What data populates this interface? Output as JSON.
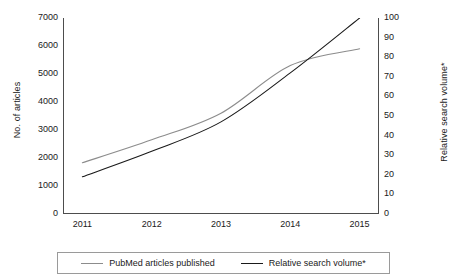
{
  "chart_data": {
    "type": "line",
    "title": "",
    "subtitle": "",
    "xlabel": "",
    "ylabel": "No. of articles",
    "y2label": "Relative search volume*",
    "categories": [
      "2011",
      "2012",
      "2013",
      "2014",
      "2015"
    ],
    "x": [
      2011,
      2012,
      2013,
      2014,
      2015
    ],
    "xlim": [
      2010.72,
      2015.28
    ],
    "ylim": [
      0,
      7000
    ],
    "y2lim": [
      0,
      100
    ],
    "yticks": [
      0,
      1000,
      2000,
      3000,
      4000,
      5000,
      6000,
      7000
    ],
    "y2ticks": [
      0,
      10,
      20,
      30,
      40,
      50,
      60,
      70,
      80,
      90,
      100
    ],
    "grid": false,
    "legend_position": "bottom",
    "series": [
      {
        "name": "PubMed articles published",
        "axis": "left",
        "color": "#8c8c8c",
        "values": [
          1830,
          2650,
          3600,
          5300,
          5900
        ]
      },
      {
        "name": "Relative search volume*",
        "axis": "right",
        "color": "#1a1a1a",
        "values": [
          19,
          32,
          47,
          72,
          100
        ]
      }
    ],
    "annotations": []
  },
  "axes": {
    "left": {
      "label": "No. of articles",
      "ticks": [
        "0",
        "1000",
        "2000",
        "3000",
        "4000",
        "5000",
        "6000",
        "7000"
      ]
    },
    "right": {
      "label": "Relative search volume*",
      "ticks": [
        "0",
        "10",
        "20",
        "30",
        "40",
        "50",
        "60",
        "70",
        "80",
        "90",
        "100"
      ]
    },
    "bottom": {
      "label": "",
      "ticks": [
        "2011",
        "2012",
        "2013",
        "2014",
        "2015"
      ]
    }
  },
  "legend": {
    "items": [
      {
        "label": "PubMed articles published",
        "color": "#8c8c8c"
      },
      {
        "label": "Relative search volume*",
        "color": "#1a1a1a"
      }
    ]
  },
  "colors": {
    "series_pubmed": "#8c8c8c",
    "series_search": "#1a1a1a",
    "axis": "#4d4d4d",
    "legend_border": "#9a9a9a",
    "background": "#ffffff"
  }
}
